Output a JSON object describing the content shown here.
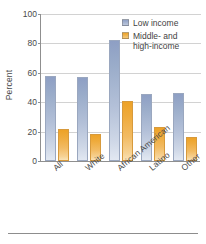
{
  "chart_data": {
    "type": "bar",
    "title": "",
    "xlabel": "",
    "ylabel": "Percent",
    "ylim": [
      0,
      100
    ],
    "yticks": [
      0,
      20,
      40,
      60,
      80,
      100
    ],
    "grid": true,
    "legend_position": "top-right",
    "categories": [
      "All",
      "White",
      "African American",
      "Latino",
      "Other"
    ],
    "series": [
      {
        "name": "Low income",
        "color": "#9badca",
        "values": [
          58,
          57,
          82,
          45.5,
          46
        ]
      },
      {
        "name": "Middle- and high-income",
        "color": "#efab3c",
        "values": [
          21.5,
          18.5,
          41,
          23,
          16
        ]
      }
    ]
  },
  "legend": {
    "items": [
      {
        "label": "Low income"
      },
      {
        "label_line1": "Middle- and",
        "label_line2": "high-income"
      }
    ]
  },
  "axis": {
    "y_title": "Percent",
    "tick_labels": [
      "100",
      "80",
      "60",
      "40",
      "20",
      "0"
    ]
  }
}
